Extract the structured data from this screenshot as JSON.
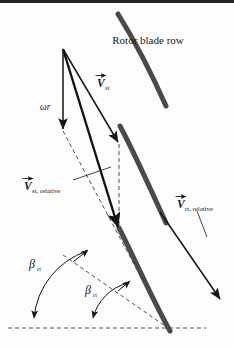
{
  "figure": {
    "name": "rotor-blade-row-velocity-triangle",
    "title": "Rotor blade row",
    "background_color": "#fdfdfd",
    "blade_color": "#4a4a4a",
    "line_color": "#141414",
    "dash_color": "#4e4e4e",
    "width": 234,
    "height": 347
  },
  "labels": {
    "rotor_blade_row": "Rotor blade row",
    "omega_r": "ωr",
    "v_symbol": "V",
    "v_st_sub": "st",
    "v_st_relative_sub": "st, relative",
    "v_rt_relative_sub": "rt, relative",
    "beta_symbol": "β",
    "beta_rt_sub": "rt",
    "beta_rt2_sub": "rt"
  },
  "blades": [
    {
      "name": "rotor-blade-top",
      "path": "M 118 14 C 133 38 150 70 166 106"
    },
    {
      "name": "rotor-blade-middle",
      "path": "M 120 126 C 134 152 150 188 166 223"
    },
    {
      "name": "rotor-blade-bottom",
      "path": "M 119 228 C 133 255 151 297 170 331"
    }
  ],
  "vectors": [
    {
      "name": "omega-r-vector",
      "from": [
        63,
        49
      ],
      "to": [
        63,
        131
      ],
      "style": "solid-arrow",
      "label": "ωr",
      "label_pos": [
        40,
        107
      ]
    },
    {
      "name": "v-st-vector",
      "from": [
        63,
        49
      ],
      "to": [
        119,
        144
      ],
      "style": "solid-arrow",
      "label": "V st",
      "label_pos": [
        98,
        82
      ]
    },
    {
      "name": "v-st-relative-vector",
      "from": [
        63,
        49
      ],
      "to": [
        119,
        230
      ],
      "style": "thick-arrow",
      "label": "V st, relative",
      "label_pos": [
        25,
        186
      ]
    },
    {
      "name": "v-rt-relative-vector",
      "from": [
        160,
        212
      ],
      "to": [
        222,
        302
      ],
      "style": "solid-arrow",
      "label": "V rt, relative",
      "label_pos": [
        178,
        201
      ]
    }
  ],
  "dashed_lines": [
    {
      "name": "dashed-vertical-from-vst-tip",
      "path": "M 119 144 L 119 230"
    },
    {
      "name": "dashed-apex-to-baseline",
      "path": "M 63 131 L 168 328"
    },
    {
      "name": "dashed-beta-rt-construction",
      "path": "M 63 255 L 168 328"
    },
    {
      "name": "dashed-baseline",
      "path": "M 8 328 L 206 328"
    },
    {
      "name": "dashed-blade-chord",
      "path": "M 119 230 L 168 328"
    }
  ],
  "angle_arcs": [
    {
      "name": "beta-rt-upper-arc",
      "path": "M 34 322 A 78 78 0 0 1 87 251",
      "label": "β rt",
      "label_pos": [
        32,
        266
      ]
    },
    {
      "name": "beta-rt-lower-arc",
      "path": "M 93 322 A 48 48 0 0 1 128 283",
      "label": "β rt",
      "label_pos": [
        88,
        291
      ]
    }
  ],
  "leaders": [
    {
      "name": "leader-v-st-relative",
      "path": "M 72 181 L 110 168"
    },
    {
      "name": "leader-v-rt-relative",
      "path": "M 196 210 L 206 236"
    }
  ]
}
